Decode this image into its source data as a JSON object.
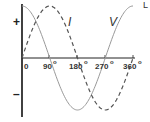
{
  "chart_data": {
    "type": "line",
    "title": "",
    "xlabel": "",
    "ylabel": "",
    "x_ticks": [
      "0",
      "90",
      "180",
      "270",
      "360"
    ],
    "x_unit_suffix": "o",
    "y_signs": {
      "positive": "+",
      "negative": "–"
    },
    "xlim": [
      0,
      360
    ],
    "ylim": [
      -1,
      1
    ],
    "grid": false,
    "series": [
      {
        "name": "V",
        "style": "solid",
        "function": "cos",
        "x": [
          0,
          90,
          180,
          270,
          360
        ],
        "values": [
          1,
          0,
          -1,
          0,
          1
        ],
        "color": "#999999"
      },
      {
        "name": "I",
        "style": "dashed",
        "function": "sin",
        "x": [
          0,
          90,
          180,
          270,
          360
        ],
        "values": [
          0,
          1,
          0,
          -1,
          0
        ],
        "color": "#555555"
      }
    ],
    "corner_label": "L"
  }
}
